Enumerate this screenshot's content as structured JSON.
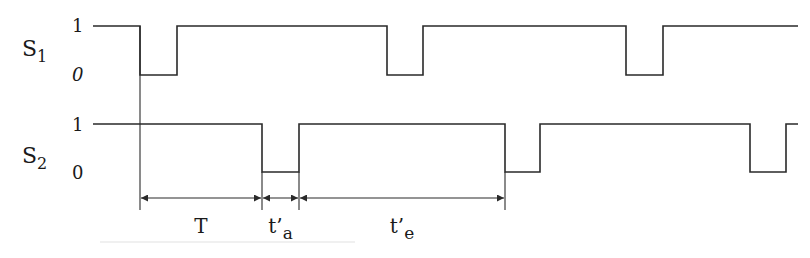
{
  "diagram": {
    "type": "timing-diagram",
    "signals": [
      {
        "name": "S1",
        "label_main": "S",
        "label_sub": "1",
        "level_high_label": "1",
        "level_low_label": "0",
        "high_y": 26,
        "low_y": 75,
        "x_start": 93,
        "x_end": 798,
        "low_pulses": [
          [
            140,
            177
          ],
          [
            387,
            423
          ],
          [
            626,
            663
          ]
        ]
      },
      {
        "name": "S2",
        "label_main": "S",
        "label_sub": "2",
        "level_high_label": "1",
        "level_low_label": "0",
        "high_y": 124,
        "low_y": 172,
        "x_start": 93,
        "x_end": 798,
        "low_pulses": [
          [
            262,
            299
          ],
          [
            505,
            540
          ],
          [
            750,
            786
          ]
        ]
      }
    ],
    "reference_line": {
      "x": 140,
      "y_top": 26,
      "y_bottom": 210
    },
    "dimension_y": 198,
    "intervals": [
      {
        "name": "T",
        "label_main": "T",
        "label_sub": "",
        "x_from": 140,
        "x_to": 262
      },
      {
        "name": "t'a",
        "label_main": "t’",
        "label_sub": "a",
        "x_from": 262,
        "x_to": 299
      },
      {
        "name": "t'e",
        "label_main": "t’",
        "label_sub": "e",
        "x_from": 299,
        "x_to": 505
      }
    ]
  }
}
